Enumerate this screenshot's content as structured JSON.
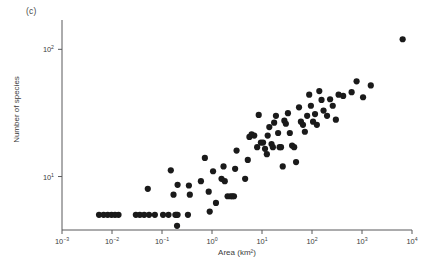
{
  "panel": {
    "label": "(c)"
  },
  "chart_data": {
    "type": "scatter",
    "title": "",
    "subtitle": "",
    "xlabel": "Area (km²)",
    "ylabel": "Number of species",
    "xscale": "log",
    "yscale": "log",
    "xlim": [
      0.001,
      10000
    ],
    "ylim": [
      3.8,
      170
    ],
    "grid": false,
    "legend": null,
    "xticks": [
      {
        "value": 0.001,
        "label_base": "10",
        "label_exp": "−3"
      },
      {
        "value": 0.01,
        "label_base": "10",
        "label_exp": "−2"
      },
      {
        "value": 0.1,
        "label_base": "10",
        "label_exp": "−1"
      },
      {
        "value": 1,
        "label_base": "10",
        "label_exp": "0"
      },
      {
        "value": 10,
        "label_base": "10",
        "label_exp": "1"
      },
      {
        "value": 100,
        "label_base": "10",
        "label_exp": "2"
      },
      {
        "value": 1000,
        "label_base": "10",
        "label_exp": "3"
      },
      {
        "value": 10000,
        "label_base": "10",
        "label_exp": "4"
      }
    ],
    "yticks": [
      {
        "value": 10,
        "label_base": "10",
        "label_exp": "1"
      },
      {
        "value": 100,
        "label_base": "10",
        "label_exp": "2"
      }
    ],
    "marker": {
      "shape": "circle",
      "size_px": 3.1,
      "color": "#1a1a1a"
    },
    "points": [
      {
        "x": 0.0055,
        "y": 5.0
      },
      {
        "x": 0.0068,
        "y": 5.0
      },
      {
        "x": 0.0082,
        "y": 5.0
      },
      {
        "x": 0.0098,
        "y": 5.0
      },
      {
        "x": 0.0115,
        "y": 5.0
      },
      {
        "x": 0.0135,
        "y": 5.0
      },
      {
        "x": 0.03,
        "y": 5.0
      },
      {
        "x": 0.036,
        "y": 5.0
      },
      {
        "x": 0.044,
        "y": 5.0
      },
      {
        "x": 0.055,
        "y": 5.0
      },
      {
        "x": 0.072,
        "y": 5.0
      },
      {
        "x": 0.052,
        "y": 8.0
      },
      {
        "x": 0.105,
        "y": 5.0
      },
      {
        "x": 0.135,
        "y": 5.0
      },
      {
        "x": 0.15,
        "y": 11.2
      },
      {
        "x": 0.17,
        "y": 7.2
      },
      {
        "x": 0.185,
        "y": 5.0
      },
      {
        "x": 0.195,
        "y": 5.0
      },
      {
        "x": 0.205,
        "y": 5.0
      },
      {
        "x": 0.2,
        "y": 4.1
      },
      {
        "x": 0.205,
        "y": 8.6
      },
      {
        "x": 0.33,
        "y": 5.0
      },
      {
        "x": 0.345,
        "y": 8.5
      },
      {
        "x": 0.36,
        "y": 7.2
      },
      {
        "x": 0.6,
        "y": 9.2
      },
      {
        "x": 0.72,
        "y": 14.0
      },
      {
        "x": 0.86,
        "y": 7.6
      },
      {
        "x": 0.9,
        "y": 5.3
      },
      {
        "x": 1.05,
        "y": 11.0
      },
      {
        "x": 1.2,
        "y": 6.2
      },
      {
        "x": 1.55,
        "y": 9.6
      },
      {
        "x": 1.7,
        "y": 12.0
      },
      {
        "x": 1.8,
        "y": 9.2
      },
      {
        "x": 2.05,
        "y": 7.0
      },
      {
        "x": 2.35,
        "y": 7.0
      },
      {
        "x": 2.55,
        "y": 7.0
      },
      {
        "x": 2.75,
        "y": 7.0
      },
      {
        "x": 2.9,
        "y": 11.5
      },
      {
        "x": 3.1,
        "y": 16.0
      },
      {
        "x": 4.6,
        "y": 9.6
      },
      {
        "x": 5.2,
        "y": 13.5
      },
      {
        "x": 5.6,
        "y": 20.5
      },
      {
        "x": 6.2,
        "y": 21.5
      },
      {
        "x": 7.0,
        "y": 21.0
      },
      {
        "x": 8.0,
        "y": 17.0
      },
      {
        "x": 8.6,
        "y": 30.5
      },
      {
        "x": 9.5,
        "y": 18.5
      },
      {
        "x": 10.5,
        "y": 18.5
      },
      {
        "x": 11.5,
        "y": 16.5
      },
      {
        "x": 12.5,
        "y": 15.0
      },
      {
        "x": 13.0,
        "y": 21.0
      },
      {
        "x": 14.0,
        "y": 24.5
      },
      {
        "x": 15.5,
        "y": 18.0
      },
      {
        "x": 16.5,
        "y": 17.0
      },
      {
        "x": 17.5,
        "y": 26.5
      },
      {
        "x": 19.0,
        "y": 30.0
      },
      {
        "x": 21.0,
        "y": 22.0
      },
      {
        "x": 22.5,
        "y": 17.0
      },
      {
        "x": 24.0,
        "y": 17.0
      },
      {
        "x": 26.0,
        "y": 12.0
      },
      {
        "x": 28.0,
        "y": 27.5
      },
      {
        "x": 30.0,
        "y": 26.0
      },
      {
        "x": 33.0,
        "y": 31.5
      },
      {
        "x": 36.0,
        "y": 22.0
      },
      {
        "x": 40.0,
        "y": 17.5
      },
      {
        "x": 44.0,
        "y": 17.0
      },
      {
        "x": 48.0,
        "y": 13.0
      },
      {
        "x": 55.0,
        "y": 35.0
      },
      {
        "x": 60.0,
        "y": 27.0
      },
      {
        "x": 66.0,
        "y": 25.5
      },
      {
        "x": 72.0,
        "y": 22.5
      },
      {
        "x": 80.0,
        "y": 30.0
      },
      {
        "x": 88.0,
        "y": 44.0
      },
      {
        "x": 95.0,
        "y": 36.0
      },
      {
        "x": 105.0,
        "y": 27.0
      },
      {
        "x": 115.0,
        "y": 31.0
      },
      {
        "x": 125.0,
        "y": 25.5
      },
      {
        "x": 140.0,
        "y": 47.0
      },
      {
        "x": 155.0,
        "y": 40.0
      },
      {
        "x": 170.0,
        "y": 33.0
      },
      {
        "x": 200.0,
        "y": 30.0
      },
      {
        "x": 230.0,
        "y": 40.5
      },
      {
        "x": 260.0,
        "y": 36.0
      },
      {
        "x": 300.0,
        "y": 28.0
      },
      {
        "x": 340.0,
        "y": 44.0
      },
      {
        "x": 420.0,
        "y": 43.0
      },
      {
        "x": 620.0,
        "y": 46.0
      },
      {
        "x": 780.0,
        "y": 56.0
      },
      {
        "x": 1050.0,
        "y": 42.0
      },
      {
        "x": 1500.0,
        "y": 52.0
      },
      {
        "x": 6500.0,
        "y": 120.0
      }
    ]
  }
}
